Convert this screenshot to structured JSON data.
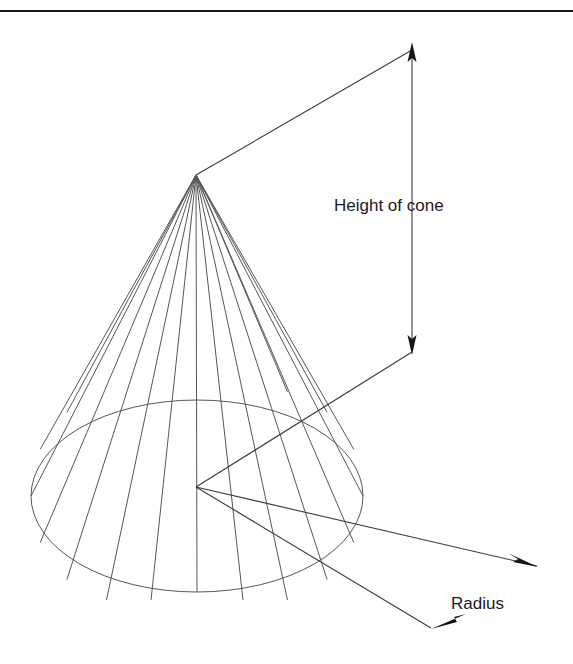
{
  "figure": {
    "type": "geometric-diagram",
    "shape": "cone",
    "background_color": "#ffffff",
    "line_color": "#55565a",
    "text_color": "#1b1b1b"
  },
  "rule": {
    "name": "top-horizontal-rule",
    "color": "#1a1a1a"
  },
  "labels": {
    "height": "Height of cone",
    "radius": "Radius"
  },
  "geometry": {
    "apex": {
      "x": 196,
      "y": 175
    },
    "base_center": {
      "x": 197,
      "y": 496
    },
    "base_rx": 166,
    "base_ry": 96,
    "generator_count": 12,
    "height_leader": {
      "top_point": {
        "x": 412,
        "y": 44
      },
      "bottom_point": {
        "x": 412,
        "y": 352
      }
    },
    "radius_leader": {
      "upper_tip": {
        "x": 537,
        "y": 566
      },
      "lower_tip": {
        "x": 431,
        "y": 628
      }
    }
  }
}
